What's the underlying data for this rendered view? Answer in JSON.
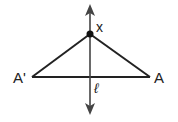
{
  "diagram": {
    "type": "geometry-reflection",
    "labels": {
      "point_x": "x",
      "point_a": "A",
      "point_a_prime": "A'",
      "line_l": "ℓ"
    },
    "points": {
      "X": [
        90,
        34
      ],
      "A": [
        150,
        77
      ],
      "A_prime": [
        32,
        77
      ]
    },
    "line_l": {
      "x": 90,
      "y_top": 5,
      "y_bottom": 114
    },
    "colors": {
      "stroke": "#222222",
      "line_l": "#444444"
    }
  }
}
